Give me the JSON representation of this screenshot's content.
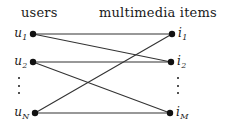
{
  "figure": {
    "type": "bipartite-graph",
    "headers": {
      "left": "users",
      "right": "multimedia items"
    },
    "colors": {
      "node": "#111111",
      "edge": "#333333",
      "text": "#1a1a1a",
      "background": "#ffffff"
    },
    "left_nodes": [
      {
        "id": "u1",
        "base": "u",
        "sub": "1",
        "x": 33,
        "y": 34
      },
      {
        "id": "u2",
        "base": "u",
        "sub": "2",
        "x": 33,
        "y": 62
      },
      {
        "id": "uN",
        "base": "u",
        "sub": "N",
        "x": 35,
        "y": 113
      }
    ],
    "right_nodes": [
      {
        "id": "i1",
        "base": "i",
        "sub": "1",
        "x": 172,
        "y": 34
      },
      {
        "id": "i2",
        "base": "i",
        "sub": "2",
        "x": 171,
        "y": 62
      },
      {
        "id": "iM",
        "base": "i",
        "sub": "M",
        "x": 170,
        "y": 113
      }
    ],
    "ellipses": [
      {
        "id": "left-ellipsis",
        "x": 17,
        "y": 77
      },
      {
        "id": "right-ellipsis",
        "x": 176,
        "y": 77
      }
    ],
    "edges": [
      {
        "from": "u1",
        "to": "i1",
        "x1": 33,
        "y1": 34,
        "x2": 172,
        "y2": 34
      },
      {
        "from": "u1",
        "to": "i2",
        "x1": 33,
        "y1": 34,
        "x2": 171,
        "y2": 62
      },
      {
        "from": "u2",
        "to": "i2",
        "x1": 33,
        "y1": 62,
        "x2": 171,
        "y2": 62
      },
      {
        "from": "u2",
        "to": "iM",
        "x1": 33,
        "y1": 62,
        "x2": 170,
        "y2": 113
      },
      {
        "from": "uN",
        "to": "i1",
        "x1": 35,
        "y1": 113,
        "x2": 172,
        "y2": 34
      },
      {
        "from": "uN",
        "to": "iM",
        "x1": 35,
        "y1": 113,
        "x2": 170,
        "y2": 113
      }
    ],
    "node_radius": 3.2,
    "edge_width": 1.1
  }
}
